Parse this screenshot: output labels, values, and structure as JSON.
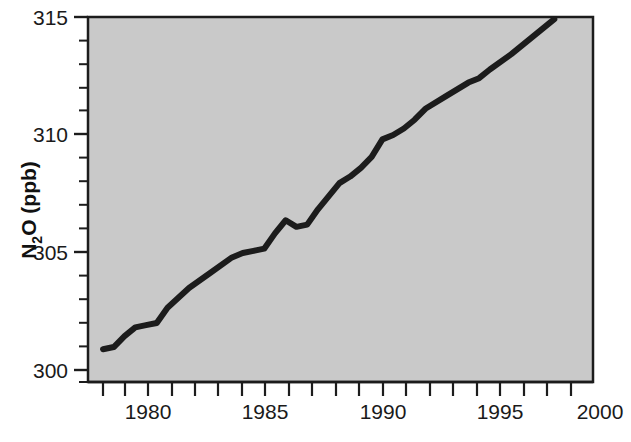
{
  "chart_data": {
    "type": "line",
    "title": "",
    "subtitle": "",
    "xlabel": "",
    "ylabel": "N2O (ppb)",
    "ylabel_parts": {
      "pre": "N",
      "sub": "2",
      "post": "O (ppb)"
    },
    "xlim": [
      1977.3,
      2000.8
    ],
    "ylim": [
      298.5,
      315.2
    ],
    "xtick_labels": [
      "1980",
      "1985",
      "1990",
      "1995",
      "2000"
    ],
    "xticks_major": [
      1980,
      1985,
      1990,
      1995,
      2000
    ],
    "xticks_minor_step": 1,
    "ytick_labels": [
      "300",
      "305",
      "310",
      "315"
    ],
    "yticks_major": [
      300,
      305,
      310,
      315
    ],
    "yticks_minor_step": 1,
    "grid": false,
    "legend": null,
    "plot_background_color": "#c9c9c9",
    "line_color": "#1c1c1c",
    "line_width_px": 6,
    "series": [
      {
        "name": "N2O",
        "x": [
          1978.0,
          1978.5,
          1979.0,
          1979.5,
          1980.0,
          1980.5,
          1981.0,
          1982.0,
          1983.0,
          1984.0,
          1984.5,
          1985.0,
          1985.5,
          1986.0,
          1986.5,
          1987.0,
          1987.5,
          1988.0,
          1989.0,
          1989.5,
          1990.0,
          1990.5,
          1991.0,
          1991.5,
          1992.0,
          1992.5,
          1993.0,
          1994.0,
          1995.0,
          1995.5,
          1996.0,
          1997.0,
          1998.0,
          1999.0
        ],
        "values": [
          300.0,
          300.1,
          300.6,
          301.0,
          301.1,
          301.2,
          301.9,
          302.8,
          303.5,
          304.2,
          304.4,
          304.5,
          304.6,
          305.3,
          305.9,
          305.6,
          305.7,
          306.4,
          307.6,
          307.9,
          308.3,
          308.8,
          309.6,
          309.8,
          310.1,
          310.5,
          311.0,
          311.6,
          312.2,
          312.4,
          312.8,
          313.5,
          314.3,
          315.1
        ]
      }
    ]
  },
  "axes": {
    "y_title": "N2O (ppb)",
    "y_tick_300": "300",
    "y_tick_305": "305",
    "y_tick_310": "310",
    "y_tick_315": "315",
    "x_tick_1980": "1980",
    "x_tick_1985": "1985",
    "x_tick_1990": "1990",
    "x_tick_1995": "1995",
    "x_tick_2000": "2000"
  },
  "footer": {
    "cropped_caption_text": ""
  }
}
